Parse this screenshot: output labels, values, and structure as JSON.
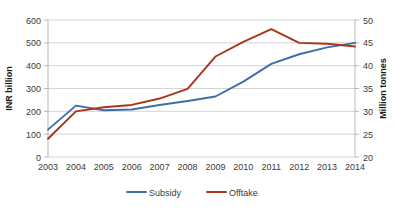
{
  "chart_data": {
    "type": "line",
    "title": "",
    "subtitle": "",
    "xlabel": "",
    "ylabel": "INR billion",
    "y2label": "Million tonnes",
    "categories": [
      "2003",
      "2004",
      "2005",
      "2006",
      "2007",
      "2008",
      "2009",
      "2010",
      "2011",
      "2012",
      "2013",
      "2014"
    ],
    "ylim": [
      0,
      600
    ],
    "yticks": [
      "0",
      "100",
      "200",
      "300",
      "400",
      "500",
      "600"
    ],
    "ytick_values": [
      0,
      100,
      200,
      300,
      400,
      500,
      600
    ],
    "y2lim": [
      20,
      50
    ],
    "y2ticks": [
      "20",
      "25",
      "30",
      "35",
      "40",
      "45",
      "50"
    ],
    "y2tick_values": [
      20,
      25,
      30,
      35,
      40,
      45,
      50
    ],
    "grid": true,
    "legend_position": "bottom",
    "series": [
      {
        "name": "Subsidy",
        "axis": "left",
        "units": "INR billion",
        "color": "#3f6DA8",
        "values": [
          120,
          225,
          205,
          208,
          228,
          245,
          265,
          330,
          408,
          450,
          480,
          500
        ]
      },
      {
        "name": "Offtake",
        "axis": "right",
        "units": "Million tonnes",
        "color": "#A8361C",
        "values": [
          24.0,
          30.0,
          30.9,
          31.4,
          32.8,
          34.9,
          42.0,
          45.2,
          48.0,
          45.0,
          44.8,
          44.2
        ]
      }
    ],
    "legend": [
      {
        "label": "Subsidy",
        "color": "#3f6DA8"
      },
      {
        "label": "Offtake",
        "color": "#A8361C"
      }
    ]
  },
  "colors": {
    "subsidy": "#3f6DA8",
    "offtake": "#A8361C",
    "grid": "#c9c9c9",
    "axis": "#b0b0b0",
    "text": "#3b3b3b",
    "background": "#ffffff"
  }
}
